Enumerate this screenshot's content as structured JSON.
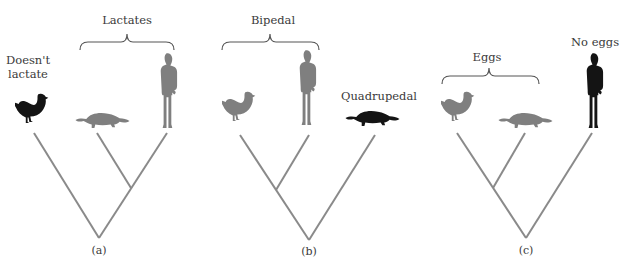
{
  "figure": {
    "panels": [
      {
        "caption": "(a)",
        "group_label": "Lactates",
        "outgroup_label": [
          "Doesn't",
          "lactate"
        ],
        "taxa": [
          "bird",
          "platypus",
          "human"
        ],
        "highlighted_taxon": "bird",
        "topology": "(bird,(platypus,human))"
      },
      {
        "caption": "(b)",
        "group_label": "Bipedal",
        "outgroup_label": [
          "Quadrupedal"
        ],
        "taxa": [
          "bird",
          "human",
          "platypus"
        ],
        "highlighted_taxon": "platypus",
        "topology": "((bird,human),platypus)"
      },
      {
        "caption": "(c)",
        "group_label": "Eggs",
        "outgroup_label": [
          "No eggs"
        ],
        "taxa": [
          "bird",
          "platypus",
          "human"
        ],
        "highlighted_taxon": "human",
        "topology": "((bird,platypus),human)"
      }
    ],
    "colors": {
      "branch": "#8a8a8a",
      "silhouette_gray": "#7f7f7f",
      "silhouette_black": "#141414",
      "text": "#3a3a3a"
    }
  }
}
